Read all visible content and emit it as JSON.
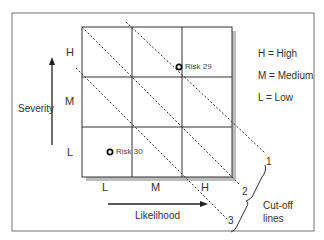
{
  "diagram": {
    "title": "",
    "y_axis": {
      "label": "Severity",
      "levels": [
        "H",
        "M",
        "L"
      ]
    },
    "x_axis": {
      "label": "Likelihood",
      "levels": [
        "L",
        "M",
        "H"
      ]
    },
    "legend": [
      {
        "text": "H = High"
      },
      {
        "text": "M = Medium"
      },
      {
        "text": "L = Low"
      }
    ],
    "risks": [
      {
        "label": "Risk 29",
        "likelihood": "H",
        "severity": "H"
      },
      {
        "label": "Risk 30",
        "likelihood": "L",
        "severity": "L"
      }
    ],
    "cutoff_lines": {
      "numbers": [
        "1",
        "2",
        "3"
      ],
      "group_label_line1": "Cut-off",
      "group_label_line2": "lines"
    },
    "colors": {
      "grid": "#333333",
      "shadow": "#bbbbbb",
      "frame": "#888888",
      "text": "#333333"
    }
  }
}
